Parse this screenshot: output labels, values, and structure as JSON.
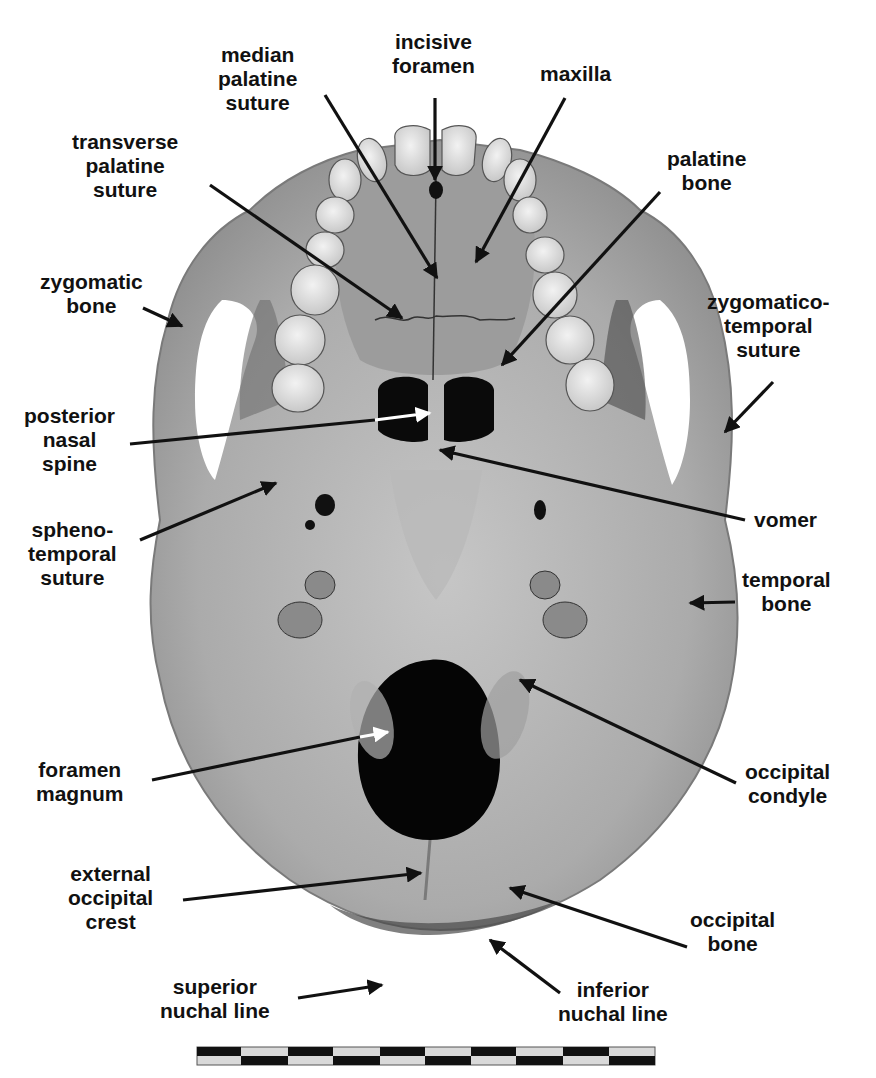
{
  "figure": {
    "colors": {
      "background": "#ffffff",
      "bone": "#a9a9a9",
      "bone_light": "#c4c4c4",
      "bone_dark": "#8a8a8a",
      "teeth": "#e2e2e2",
      "cavity": "#060606",
      "text": "#111111",
      "arrow_black": "#111111",
      "arrow_white": "#ffffff"
    },
    "labels": [
      {
        "id": "incisive-foramen",
        "lines": [
          "incisive",
          "foramen"
        ],
        "arrow": "black"
      },
      {
        "id": "median-palatine-suture",
        "lines": [
          "median",
          "palatine",
          "suture"
        ],
        "arrow": "black"
      },
      {
        "id": "maxilla",
        "lines": [
          "maxilla"
        ],
        "arrow": "black"
      },
      {
        "id": "transverse-palatine-suture",
        "lines": [
          "transverse",
          "palatine",
          "suture"
        ],
        "arrow": "black"
      },
      {
        "id": "palatine-bone",
        "lines": [
          "palatine",
          "bone"
        ],
        "arrow": "black"
      },
      {
        "id": "zygomatic-bone",
        "lines": [
          "zygomatic",
          "bone"
        ],
        "arrow": "black"
      },
      {
        "id": "zygomatico-temporal-suture",
        "lines": [
          "zygomatico-",
          "temporal",
          "suture"
        ],
        "arrow": "black"
      },
      {
        "id": "posterior-nasal-spine",
        "lines": [
          "posterior",
          "nasal",
          "spine"
        ],
        "arrow": "white"
      },
      {
        "id": "spheno-temporal-suture",
        "lines": [
          "spheno-",
          "temporal",
          "suture"
        ],
        "arrow": "black"
      },
      {
        "id": "vomer",
        "lines": [
          "vomer"
        ],
        "arrow": "black"
      },
      {
        "id": "temporal-bone",
        "lines": [
          "temporal",
          "bone"
        ],
        "arrow": "black"
      },
      {
        "id": "foramen-magnum",
        "lines": [
          "foramen",
          "magnum"
        ],
        "arrow": "white"
      },
      {
        "id": "occipital-condyle",
        "lines": [
          "occipital",
          "condyle"
        ],
        "arrow": "black"
      },
      {
        "id": "external-occipital-crest",
        "lines": [
          "external",
          "occipital",
          "crest"
        ],
        "arrow": "black"
      },
      {
        "id": "occipital-bone",
        "lines": [
          "occipital",
          "bone"
        ],
        "arrow": "black"
      },
      {
        "id": "superior-nuchal-line",
        "lines": [
          "superior",
          "nuchal line"
        ],
        "arrow": "black"
      },
      {
        "id": "inferior-nuchal-line",
        "lines": [
          "inferior",
          "nuchal line"
        ],
        "arrow": "black"
      }
    ],
    "scale_bar": {
      "segments_per_row": 10,
      "rows": 2,
      "pattern": "alternating black/grey checker"
    }
  }
}
